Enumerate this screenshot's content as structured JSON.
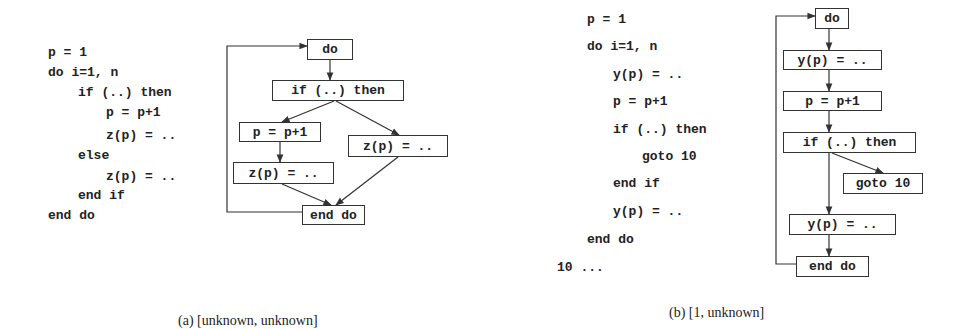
{
  "figure_a": {
    "code_lines": [
      {
        "text": "p = 1",
        "indent": 0
      },
      {
        "text": "do i=1, n",
        "indent": 0
      },
      {
        "text": "if (..) then",
        "indent": 1
      },
      {
        "text": "p = p+1",
        "indent": 2
      },
      {
        "text": "z(p) = ..",
        "indent": 2
      },
      {
        "text": "else",
        "indent": 1
      },
      {
        "text": "z(p) = ..",
        "indent": 2
      },
      {
        "text": "end if",
        "indent": 1
      },
      {
        "text": "end do",
        "indent": 0
      }
    ],
    "nodes": {
      "do": "do",
      "if": "if (..) then",
      "p_inc": "p = p+1",
      "z_left": "z(p) = ..",
      "z_right": "z(p) = ..",
      "end_do": "end do"
    },
    "caption": "(a) [unknown, unknown]"
  },
  "figure_b": {
    "code_lines": [
      {
        "text": "p = 1",
        "indent": 0
      },
      {
        "text": "do i=1, n",
        "indent": 0
      },
      {
        "text": "y(p) = ..",
        "indent": 1
      },
      {
        "text": "p = p+1",
        "indent": 1
      },
      {
        "text": "if (..) then",
        "indent": 1
      },
      {
        "text": "goto 10",
        "indent": 2
      },
      {
        "text": "end if",
        "indent": 1
      },
      {
        "text": "y(p) = ..",
        "indent": 1
      },
      {
        "text": "end do",
        "indent": 0
      },
      {
        "text": "10 ...",
        "indent": -1
      }
    ],
    "nodes": {
      "do": "do",
      "y_top": "y(p) = ..",
      "p_inc": "p = p+1",
      "if": "if (..) then",
      "goto": "goto 10",
      "y_bottom": "y(p) = ..",
      "end_do": "end do"
    },
    "caption": "(b) [1, unknown]"
  }
}
